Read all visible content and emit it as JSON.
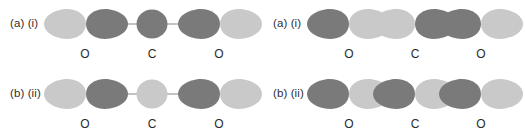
{
  "figure": {
    "background_color": "#ffffff",
    "colors": {
      "dark_lobe": "#7a7a7a",
      "light_lobe": "#c9c9c9",
      "bond_line": "#9a9a9a",
      "text": "#2b2b2b"
    }
  },
  "panels": [
    {
      "id": "panel-top-left",
      "label": "(a) (i)",
      "label_part_a": "(a)",
      "label_part_b": "(i)",
      "style": "separated",
      "atom_labels": [
        "O",
        "C",
        "O"
      ],
      "atoms": [
        {
          "element": "O",
          "label": "O",
          "center_x": 85,
          "type": "p-orbital",
          "lobes": [
            {
              "side": "left",
              "shade": "light",
              "color": "#c9c9c9"
            },
            {
              "side": "right",
              "shade": "dark",
              "color": "#7a7a7a"
            }
          ]
        },
        {
          "element": "C",
          "label": "C",
          "center_x": 152,
          "type": "s-orbital-circle",
          "lobes": [
            {
              "side": "center",
              "shade": "dark",
              "color": "#7a7a7a"
            }
          ]
        },
        {
          "element": "O",
          "label": "O",
          "center_x": 219,
          "type": "p-orbital",
          "lobes": [
            {
              "side": "left",
              "shade": "dark",
              "color": "#7a7a7a"
            },
            {
              "side": "right",
              "shade": "light",
              "color": "#c9c9c9"
            }
          ]
        }
      ],
      "bond_lines": [
        {
          "from_x": 112,
          "to_x": 138
        },
        {
          "from_x": 166,
          "to_x": 192
        }
      ]
    },
    {
      "id": "panel-top-right",
      "label": "(a) (i)",
      "label_part_a": "(a)",
      "label_part_b": "(i)",
      "style": "contiguous",
      "atom_labels": [
        "O",
        "C",
        "O"
      ],
      "atoms": [
        {
          "element": "O",
          "label": "O",
          "center_x": 86,
          "type": "p-orbital",
          "lobes": [
            {
              "side": "left",
              "shade": "dark",
              "color": "#7a7a7a"
            },
            {
              "side": "right",
              "shade": "light",
              "color": "#c9c9c9"
            }
          ]
        },
        {
          "element": "C",
          "label": "C",
          "center_x": 152,
          "type": "p-orbital",
          "lobes": [
            {
              "side": "left",
              "shade": "light",
              "color": "#c9c9c9"
            },
            {
              "side": "right",
              "shade": "dark",
              "color": "#7a7a7a"
            }
          ]
        },
        {
          "element": "O",
          "label": "O",
          "center_x": 218,
          "type": "p-orbital",
          "lobes": [
            {
              "side": "left",
              "shade": "dark",
              "color": "#7a7a7a"
            },
            {
              "side": "right",
              "shade": "light",
              "color": "#c9c9c9"
            }
          ]
        }
      ],
      "bond_lines": []
    },
    {
      "id": "panel-bottom-left",
      "label": "(b) (ii)",
      "label_part_a": "(b)",
      "label_part_b": "(ii)",
      "style": "separated",
      "atom_labels": [
        "O",
        "C",
        "O"
      ],
      "atoms": [
        {
          "element": "O",
          "label": "O",
          "center_x": 85,
          "type": "p-orbital",
          "lobes": [
            {
              "side": "left",
              "shade": "light",
              "color": "#c9c9c9"
            },
            {
              "side": "right",
              "shade": "dark",
              "color": "#7a7a7a"
            }
          ]
        },
        {
          "element": "C",
          "label": "C",
          "center_x": 152,
          "type": "s-orbital-circle",
          "lobes": [
            {
              "side": "center",
              "shade": "light",
              "color": "#c9c9c9"
            }
          ]
        },
        {
          "element": "O",
          "label": "O",
          "center_x": 219,
          "type": "p-orbital",
          "lobes": [
            {
              "side": "left",
              "shade": "dark",
              "color": "#7a7a7a"
            },
            {
              "side": "right",
              "shade": "light",
              "color": "#c9c9c9"
            }
          ]
        }
      ],
      "bond_lines": [
        {
          "from_x": 112,
          "to_x": 138
        },
        {
          "from_x": 166,
          "to_x": 192
        }
      ]
    },
    {
      "id": "panel-bottom-right",
      "label": "(b) (ii)",
      "label_part_a": "(b)",
      "label_part_b": "(ii)",
      "style": "contiguous",
      "atom_labels": [
        "O",
        "C",
        "O"
      ],
      "atoms": [
        {
          "element": "O",
          "label": "O",
          "center_x": 86,
          "type": "p-orbital",
          "lobes": [
            {
              "side": "left",
              "shade": "dark",
              "color": "#7a7a7a"
            },
            {
              "side": "right",
              "shade": "light",
              "color": "#c9c9c9"
            }
          ]
        },
        {
          "element": "C",
          "label": "C",
          "center_x": 152,
          "type": "p-orbital",
          "lobes": [
            {
              "side": "left",
              "shade": "dark",
              "color": "#7a7a7a"
            },
            {
              "side": "right",
              "shade": "light",
              "color": "#c9c9c9"
            }
          ]
        },
        {
          "element": "O",
          "label": "O",
          "center_x": 218,
          "type": "p-orbital",
          "lobes": [
            {
              "side": "left",
              "shade": "dark",
              "color": "#7a7a7a"
            },
            {
              "side": "right",
              "shade": "light",
              "color": "#c9c9c9"
            }
          ]
        }
      ],
      "bond_lines": []
    }
  ]
}
